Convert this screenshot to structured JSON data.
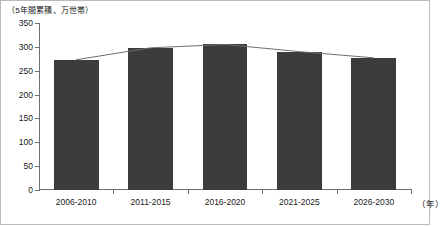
{
  "chart_data": {
    "type": "bar",
    "title": "",
    "subtitle": "",
    "unit_label": "（5年間累積、万世帯）",
    "xlabel": "（年）",
    "ylabel": "",
    "categories": [
      "2006-2010",
      "2011-2015",
      "2016-2020",
      "2021-2025",
      "2026-2030"
    ],
    "values": [
      273,
      298,
      305,
      290,
      277
    ],
    "series": [
      {
        "name": "5年間累積世帯数",
        "type": "bar",
        "values": [
          273,
          298,
          305,
          290,
          277
        ]
      },
      {
        "name": "推移線",
        "type": "line",
        "values": [
          273,
          298,
          305,
          290,
          277
        ]
      }
    ],
    "ylim": [
      0,
      350
    ],
    "yticks": [
      0,
      50,
      100,
      150,
      200,
      250,
      300,
      350
    ],
    "ytick_labels": [
      "0",
      "50",
      "100",
      "150",
      "200",
      "250",
      "300",
      "350"
    ],
    "grid": false,
    "legend": "none",
    "bar_color": "#3b3b3b",
    "line_color": "#6f6f6f",
    "axis_color": "#6f6f6f",
    "background_color": "#ffffff",
    "border_color": "#b9b9b9"
  }
}
